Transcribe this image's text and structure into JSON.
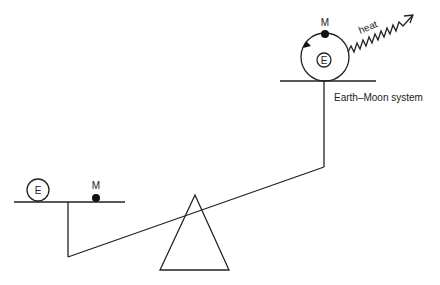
{
  "diagram": {
    "title": "",
    "colors": {
      "stroke": "#222222",
      "background": "#ffffff"
    },
    "left_pan": {
      "earth_label": "E",
      "moon_label": "M"
    },
    "right_pan": {
      "earth_label": "E",
      "moon_label": "M",
      "heat_label": "heat",
      "system_label": "Earth–Moon system"
    },
    "fulcrum": "triangle"
  }
}
